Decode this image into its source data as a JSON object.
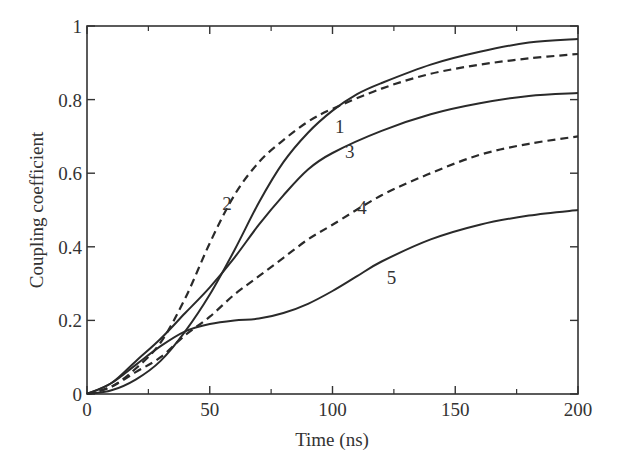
{
  "chart_data": {
    "type": "line",
    "title": "",
    "xlabel": "Time (ns)",
    "ylabel": "Coupling coefficient",
    "xlim": [
      0,
      200
    ],
    "ylim": [
      0,
      1
    ],
    "x_ticks": [
      0,
      50,
      100,
      150,
      200
    ],
    "x_minor_ticks": [
      25,
      75,
      125,
      175
    ],
    "y_ticks": [
      0,
      0.2,
      0.4,
      0.6,
      0.8,
      1
    ],
    "y_tick_labels": [
      "0",
      "0.2",
      "0.4",
      "0.6",
      "0.8",
      "1"
    ],
    "x_tick_labels": [
      "0",
      "50",
      "100",
      "150",
      "200"
    ],
    "grid": false,
    "legend": "none (inline curve numbers)",
    "series": [
      {
        "name": "1",
        "style": "solid",
        "label_pos": [
          103,
          0.71
        ],
        "x": [
          0,
          10,
          20,
          30,
          40,
          50,
          60,
          70,
          80,
          90,
          100,
          110,
          120,
          140,
          160,
          180,
          200
        ],
        "y": [
          0,
          0.01,
          0.04,
          0.09,
          0.17,
          0.27,
          0.39,
          0.52,
          0.63,
          0.71,
          0.77,
          0.815,
          0.845,
          0.895,
          0.93,
          0.955,
          0.965
        ]
      },
      {
        "name": "2",
        "style": "dashed",
        "label_pos": [
          57,
          0.5
        ],
        "x": [
          0,
          10,
          20,
          30,
          40,
          50,
          60,
          70,
          80,
          90,
          100,
          120,
          140,
          160,
          180,
          200
        ],
        "y": [
          0,
          0.02,
          0.07,
          0.14,
          0.26,
          0.41,
          0.54,
          0.63,
          0.69,
          0.74,
          0.775,
          0.83,
          0.87,
          0.895,
          0.912,
          0.924
        ]
      },
      {
        "name": "3",
        "style": "solid",
        "label_pos": [
          107,
          0.64
        ],
        "x": [
          0,
          10,
          20,
          30,
          40,
          50,
          60,
          70,
          80,
          90,
          100,
          120,
          140,
          160,
          180,
          200
        ],
        "y": [
          0,
          0.03,
          0.09,
          0.15,
          0.22,
          0.29,
          0.37,
          0.46,
          0.54,
          0.61,
          0.655,
          0.715,
          0.76,
          0.79,
          0.81,
          0.818
        ]
      },
      {
        "name": "4",
        "style": "dashed",
        "label_pos": [
          112,
          0.49
        ],
        "x": [
          0,
          10,
          20,
          30,
          40,
          50,
          60,
          70,
          80,
          90,
          100,
          120,
          140,
          160,
          180,
          200
        ],
        "y": [
          0,
          0.02,
          0.06,
          0.1,
          0.16,
          0.21,
          0.27,
          0.32,
          0.37,
          0.42,
          0.46,
          0.54,
          0.6,
          0.65,
          0.68,
          0.7
        ]
      },
      {
        "name": "5",
        "style": "solid",
        "label_pos": [
          124,
          0.3
        ],
        "x": [
          0,
          10,
          20,
          30,
          40,
          50,
          60,
          70,
          80,
          90,
          100,
          110,
          120,
          140,
          160,
          180,
          200
        ],
        "y": [
          0,
          0.03,
          0.08,
          0.13,
          0.17,
          0.19,
          0.2,
          0.205,
          0.22,
          0.245,
          0.28,
          0.32,
          0.36,
          0.42,
          0.46,
          0.485,
          0.5
        ]
      }
    ]
  },
  "colors": {
    "line": "#2a2a2a",
    "axis": "#333333",
    "background": "#ffffff"
  }
}
